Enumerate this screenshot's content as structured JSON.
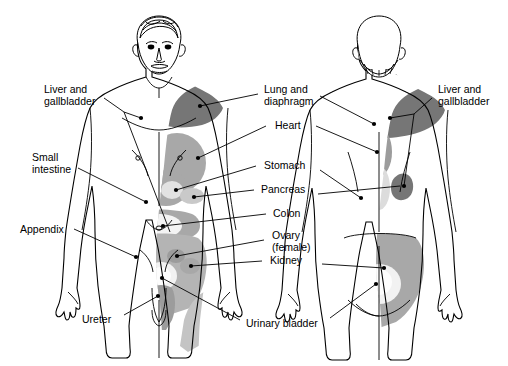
{
  "figure": {
    "type": "anatomical-diagram",
    "views": [
      {
        "name": "anterior",
        "description": "Front view of human figure showing shaded referred-pain regions"
      },
      {
        "name": "posterior",
        "description": "Back view of human figure showing shaded referred-pain regions"
      }
    ],
    "background": "#ffffff",
    "line_color": "#000000"
  },
  "palette": {
    "dark_gray": "#767676",
    "mid_gray": "#a8a8a8",
    "light_gray": "#c9c9c9",
    "pale_gray": "#e2e2e2",
    "outline": "#000000",
    "text": "#000000"
  },
  "labels": {
    "left": [
      {
        "id": "liver-gallbladder-left",
        "text": "Liver and\ngallbladder",
        "x": 44,
        "y": 84,
        "align": "left"
      },
      {
        "id": "small-intestine",
        "text": "Small\nintestine",
        "x": 32,
        "y": 152,
        "align": "left"
      },
      {
        "id": "appendix",
        "text": "Appendix",
        "x": 20,
        "y": 224,
        "align": "left"
      },
      {
        "id": "ureter",
        "text": "Ureter",
        "x": 82,
        "y": 314,
        "align": "left"
      }
    ],
    "center": [
      {
        "id": "lung-diaphragm",
        "text": "Lung and\ndiaphragm",
        "x": 264,
        "y": 84,
        "align": "left"
      },
      {
        "id": "heart",
        "text": "Heart",
        "x": 275,
        "y": 120,
        "align": "left"
      },
      {
        "id": "stomach",
        "text": "Stomach",
        "x": 264,
        "y": 160,
        "align": "left"
      },
      {
        "id": "pancreas",
        "text": "Pancreas",
        "x": 261,
        "y": 184,
        "align": "left"
      },
      {
        "id": "colon",
        "text": "Colon",
        "x": 273,
        "y": 208,
        "align": "left"
      },
      {
        "id": "ovary-female",
        "text": "Ovary\n(female)",
        "x": 272,
        "y": 230,
        "align": "left"
      },
      {
        "id": "kidney",
        "text": "Kidney",
        "x": 270,
        "y": 255,
        "align": "left"
      },
      {
        "id": "urinary-bladder",
        "text": "Urinary bladder",
        "x": 246,
        "y": 318,
        "align": "left"
      }
    ],
    "right": [
      {
        "id": "liver-gallbladder-right",
        "text": "Liver and\ngallbladder",
        "x": 438,
        "y": 84,
        "align": "left"
      }
    ]
  },
  "organs": [
    "Liver and gallbladder",
    "Small intestine",
    "Appendix",
    "Ureter",
    "Lung and diaphragm",
    "Heart",
    "Stomach",
    "Pancreas",
    "Colon",
    "Ovary (female)",
    "Kidney",
    "Urinary bladder"
  ]
}
